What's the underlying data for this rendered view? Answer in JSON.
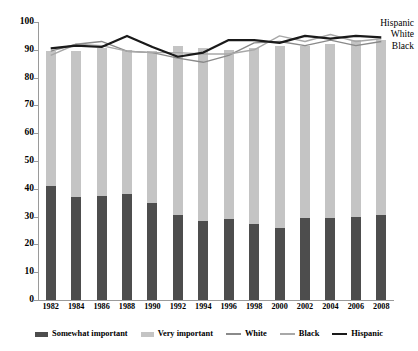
{
  "chart_data": {
    "type": "bar",
    "title": "",
    "xlabel": "",
    "ylabel": "",
    "ylim": [
      0,
      100
    ],
    "yticks": [
      0,
      10,
      20,
      30,
      40,
      50,
      60,
      70,
      80,
      90,
      100
    ],
    "grid": false,
    "legend_position": "bottom",
    "categories": [
      "1982",
      "1984",
      "1986",
      "1988",
      "1990",
      "1992",
      "1994",
      "1996",
      "1998",
      "2000",
      "2002",
      "2004",
      "2006",
      "2008"
    ],
    "stacked_bars": {
      "stacking": "bottom-to-top",
      "series": [
        {
          "name": "Somewhat important",
          "color": "#4d4d4d",
          "values": [
            41,
            37,
            37.5,
            38,
            35,
            30.5,
            28.5,
            29,
            27.5,
            26,
            29.5,
            29.5,
            30,
            30.5
          ]
        },
        {
          "name": "Very important",
          "color": "#c4c4c4",
          "values": [
            48.5,
            52.5,
            53,
            52,
            54.5,
            61,
            62,
            61,
            63,
            65.5,
            62,
            62.5,
            63.5,
            63
          ]
        }
      ],
      "totals": [
        89.5,
        89.5,
        90.5,
        90,
        89.5,
        91.5,
        90.5,
        90,
        90.5,
        91.5,
        91.5,
        92,
        93.5,
        93.5
      ]
    },
    "line_series": [
      {
        "name": "White",
        "color": "#8a8a8a",
        "width": 1.4,
        "values": [
          89.5,
          92,
          93,
          89.5,
          89,
          87,
          85.5,
          88,
          92.5,
          93,
          91.5,
          93.5,
          91.5,
          93
        ]
      },
      {
        "name": "Black",
        "color": "#a8a8a8",
        "width": 1.4,
        "values": [
          88,
          92,
          91.5,
          89.5,
          89,
          89,
          88.5,
          88.5,
          90,
          95,
          93,
          95.5,
          93,
          94
        ]
      },
      {
        "name": "Hispanic",
        "color": "#1a1a1a",
        "width": 2.2,
        "values": [
          90.5,
          91.5,
          91,
          95,
          91,
          87.5,
          89,
          93.5,
          93.5,
          92.5,
          95,
          94,
          95,
          94.5
        ]
      }
    ],
    "edge_labels": [
      "Hispanic",
      "White",
      "Black"
    ],
    "legend_entries": [
      {
        "label": "Somewhat important",
        "type": "bar",
        "color": "#4d4d4d"
      },
      {
        "label": "Very important",
        "type": "bar",
        "color": "#c4c4c4"
      },
      {
        "label": "White",
        "type": "line",
        "color": "#8a8a8a"
      },
      {
        "label": "Black",
        "type": "line",
        "color": "#a8a8a8"
      },
      {
        "label": "Hispanic",
        "type": "line",
        "color": "#1a1a1a"
      }
    ]
  }
}
